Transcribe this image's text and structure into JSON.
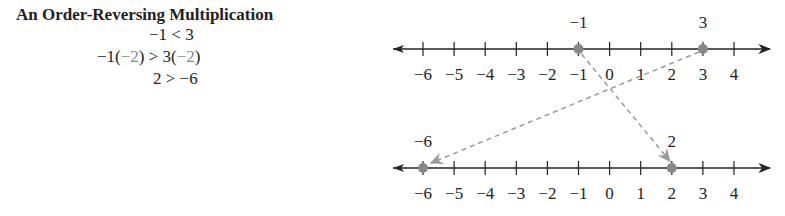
{
  "title": "An Order-Reversing Multiplication",
  "equations": [
    {
      "lhs": "−1 < 3"
    },
    {
      "a": "−1(",
      "m1": "−2",
      "b": ") > 3(",
      "m2": "−2",
      "c": ")"
    },
    {
      "lhs": "2 > −6"
    }
  ],
  "top_line": {
    "ticks": [
      "−6",
      "−5",
      "−4",
      "−3",
      "−2",
      "−1",
      "0",
      "1",
      "2",
      "3",
      "4"
    ],
    "points": [
      {
        "value": -1,
        "label": "−1"
      },
      {
        "value": 3,
        "label": "3"
      }
    ]
  },
  "bottom_line": {
    "ticks": [
      "−6",
      "−5",
      "−4",
      "−3",
      "−2",
      "−1",
      "0",
      "1",
      "2",
      "3",
      "4"
    ],
    "points": [
      {
        "value": -6,
        "label": "−6"
      },
      {
        "value": 2,
        "label": "2"
      }
    ]
  },
  "colors": {
    "line": "#222222",
    "point": "#888888",
    "arrow": "#999999"
  }
}
